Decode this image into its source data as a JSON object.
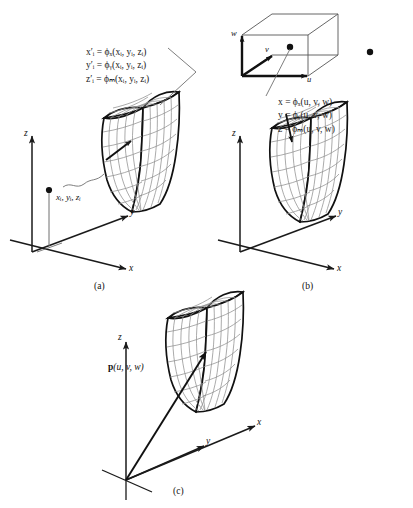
{
  "figure": {
    "background_color": "#ffffff",
    "ink_color": "#1a1a1a",
    "mesh_color": "#8a8a8a"
  },
  "panel_a": {
    "caption": "(a)",
    "axes": {
      "z": "z",
      "y": "y",
      "x": "x"
    },
    "point_label": "xᵢ, yᵢ, zᵢ",
    "equations": [
      {
        "lhs": "x",
        "lhs_sub": "i",
        "lhs_prime": "′",
        "op": "=",
        "fn": "ϕ",
        "fn_sub": "x",
        "args": "(xᵢ, yᵢ, zᵢ)"
      },
      {
        "lhs": "y",
        "lhs_sub": "i",
        "lhs_prime": "′",
        "op": "=",
        "fn": "ϕ",
        "fn_sub": "y",
        "args": "(xᵢ, yᵢ, zᵢ)"
      },
      {
        "lhs": "z",
        "lhs_sub": "i",
        "lhs_prime": "′",
        "op": "=",
        "fn": "ϕ",
        "fn_sub": "z",
        "args": "(xᵢ, yᵢ, zᵢ)"
      }
    ],
    "equations_plain": [
      "x′ᵢ = ϕₓ(xᵢ, yᵢ, zᵢ)",
      "y′ᵢ = ϕᵧ(xᵢ, yᵢ, zᵢ)",
      "z′ᵢ = ϕₘ(xᵢ, yᵢ, zᵢ)"
    ]
  },
  "panel_b": {
    "caption": "(b)",
    "axes": {
      "z": "z",
      "y": "y",
      "x": "x"
    },
    "param_axes": {
      "w": "w",
      "v": "v",
      "u": "u"
    },
    "equations_plain": [
      "x = ϕₓ(u, v, w)",
      "y = ϕᵧ(u, v, w)",
      "z = ϕₘ(u, v, w)"
    ]
  },
  "panel_c": {
    "caption": "(c)",
    "axes": {
      "z": "z",
      "y": "y",
      "x": "x"
    },
    "vector_label_bold": "p",
    "vector_label_args": "(u, v, w)"
  }
}
